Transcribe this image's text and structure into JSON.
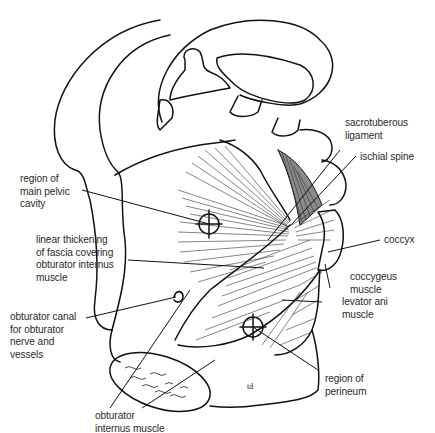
{
  "figure": {
    "type": "anatomical line drawing",
    "colors": {
      "ink": "#111111",
      "label_text": "#2a2a2a",
      "shaded_muscle": "#8a8a8a",
      "background": "#ffffff"
    },
    "labels": {
      "sacrotuberous": "sacrotuberous\nligament",
      "ischial_spine": "ischial spine",
      "main_pelvic": "region of\nmain pelvic\ncavity",
      "coccyx": "coccyx",
      "linear_thickening": "linear thickening\nof fascia covering\nobturator internus\nmuscle",
      "coccygeus": "coccygeus\nmuscle",
      "levator_ani": "levator ani\nmuscle",
      "obturator_canal": "obturator canal\nfor obturator\nnerve and\nvessels",
      "perineum": "region of\nperineum",
      "obturator_internus": "obturator\ninternus muscle"
    },
    "signature": "td"
  }
}
